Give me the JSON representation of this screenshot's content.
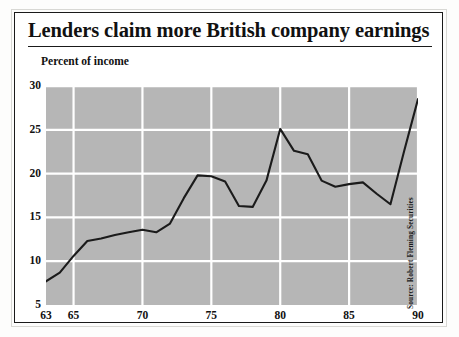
{
  "figure": {
    "title": "Lenders claim more British company earnings",
    "source_note": "Source: Robert Fleming Securities"
  },
  "colors": {
    "plot_background": "#b6b6b6",
    "gridline": "#ffffff",
    "line": "#1b1b1b",
    "frame": "#1a1a1a",
    "page_background": "#ffffff",
    "text": "#111111"
  },
  "chart_data": {
    "type": "line",
    "title": "Lenders claim more British company earnings",
    "subtitle": "",
    "xlabel": "",
    "ylabel": "Percent of income",
    "xlim": [
      63,
      90
    ],
    "ylim": [
      5,
      30
    ],
    "grid": true,
    "legend": false,
    "annotations": [
      "Source: Robert Fleming Securities"
    ],
    "ytick_labels": [
      "5",
      "10",
      "15",
      "20",
      "25",
      "30"
    ],
    "ytick_values": [
      5,
      10,
      15,
      20,
      25,
      30
    ],
    "xtick_labels": [
      "63",
      "65",
      "70",
      "75",
      "80",
      "85",
      "90"
    ],
    "xtick_values": [
      63,
      65,
      70,
      75,
      80,
      85,
      90
    ],
    "series": [
      {
        "name": "Percent of income",
        "x": [
          63,
          64,
          65,
          66,
          67,
          68,
          69,
          70,
          71,
          72,
          73,
          74,
          75,
          76,
          77,
          78,
          79,
          80,
          81,
          82,
          83,
          84,
          85,
          86,
          87,
          88,
          89,
          90
        ],
        "values": [
          7.7,
          8.7,
          10.6,
          12.3,
          12.6,
          13.0,
          13.3,
          13.6,
          13.3,
          14.3,
          17.2,
          19.8,
          19.7,
          19.1,
          16.3,
          16.2,
          19.2,
          25.1,
          22.6,
          22.2,
          19.2,
          18.5,
          18.8,
          19.0,
          17.7,
          16.5,
          22.6,
          28.5
        ]
      }
    ]
  }
}
